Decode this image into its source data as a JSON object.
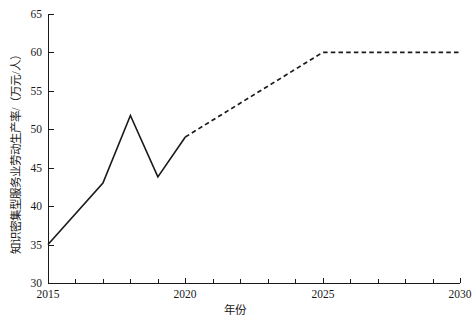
{
  "chart_data": {
    "type": "line",
    "title": "",
    "xlabel": "年份",
    "ylabel": "知识密集型服务业劳动生产率/（万元/人）",
    "xlim": [
      2015,
      2030
    ],
    "ylim": [
      30,
      65
    ],
    "x_major_ticks": [
      2015,
      2020,
      2025,
      2030
    ],
    "x_minor_tick_step": 1,
    "y_major_ticks": [
      30,
      35,
      40,
      45,
      50,
      55,
      60,
      65
    ],
    "grid": false,
    "legend": "none",
    "series": [
      {
        "name": "历史值",
        "style": "solid",
        "color": "#1a1a1a",
        "x": [
          2015,
          2017,
          2018,
          2019,
          2020
        ],
        "values": [
          35.0,
          43.0,
          51.8,
          43.8,
          49.0
        ]
      },
      {
        "name": "预测值",
        "style": "dashed",
        "color": "#1a1a1a",
        "x": [
          2020,
          2025,
          2030
        ],
        "values": [
          49.0,
          60.0,
          60.0
        ]
      }
    ]
  },
  "axis": {
    "y_tick_labels": [
      "65",
      "60",
      "55",
      "50",
      "45",
      "40",
      "35",
      "30"
    ],
    "x_tick_labels": [
      "2015",
      "2020",
      "2025",
      "2030"
    ],
    "y_title": "知识密集型服务业劳动生产率/（万元/人）",
    "x_title": "年份"
  }
}
